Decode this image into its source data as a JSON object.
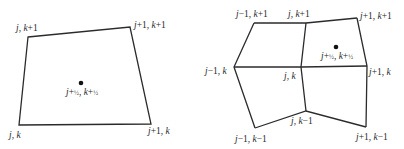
{
  "left_cell": {
    "corners": {
      "tl": {
        "x": 28,
        "y": 37,
        "label": "j, k+1"
      },
      "tr": {
        "x": 130,
        "y": 27,
        "label": "j+1, k+1"
      },
      "br": {
        "x": 151,
        "y": 124,
        "label": "j+1, k"
      },
      "bl": {
        "x": 19,
        "y": 125,
        "label": "j, k"
      }
    },
    "center": {
      "x": 81,
      "y": 83,
      "label": "j+½, k+½"
    }
  },
  "right_grid": {
    "nodes": {
      "jm1_kp1": {
        "x": 254,
        "y": 23,
        "label": "j−1, k+1"
      },
      "j_kp1": {
        "x": 306,
        "y": 23,
        "label": "j, k+1"
      },
      "jp1_kp1": {
        "x": 357,
        "y": 18,
        "label": "j+1, k+1"
      },
      "jm1_k": {
        "x": 234,
        "y": 67,
        "label": "j−1, k"
      },
      "j_k": {
        "x": 301,
        "y": 67,
        "label": "j, k"
      },
      "jp1_k": {
        "x": 367,
        "y": 66,
        "label": "j+1, k"
      },
      "jm1_km1": {
        "x": 255,
        "y": 128,
        "label": "j−1, k−1"
      },
      "j_km1": {
        "x": 306,
        "y": 111,
        "label": "j, k−1"
      },
      "jp1_km1": {
        "x": 366,
        "y": 127,
        "label": "j+1, k−1"
      }
    },
    "center": {
      "x": 336,
      "y": 47,
      "label": "j+½, k+½"
    }
  },
  "colors": {
    "stroke": "#2b2b2b",
    "text": "#2a2a2a",
    "background": "#ffffff"
  }
}
